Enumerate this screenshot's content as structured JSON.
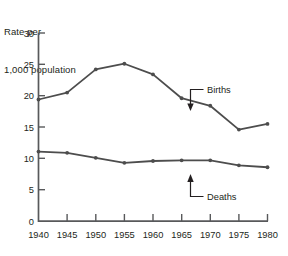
{
  "chart_data": {
    "type": "line",
    "title": "Rate per\n1,000 population",
    "title_line1": "Rate per",
    "title_line2": "1,000 population",
    "xlabel": "",
    "ylabel": "Rate per 1,000 population",
    "x": [
      1940,
      1945,
      1950,
      1955,
      1960,
      1965,
      1970,
      1975,
      1980
    ],
    "categories": [
      "1940",
      "1945",
      "1950",
      "1955",
      "1960",
      "1965",
      "1970",
      "1975",
      "1980"
    ],
    "xlim": [
      1940,
      1980
    ],
    "ylim": [
      0,
      30
    ],
    "yticks": [
      0,
      5,
      10,
      15,
      20,
      25,
      30
    ],
    "ytick_labels": [
      "0",
      "5",
      "10",
      "15",
      "20",
      "25",
      "30"
    ],
    "xticks": [
      1940,
      1945,
      1950,
      1955,
      1960,
      1965,
      1970,
      1975,
      1980
    ],
    "xtick_labels": [
      "1940",
      "1945",
      "1950",
      "1955",
      "1960",
      "1965",
      "1970",
      "1975",
      "1980"
    ],
    "grid": false,
    "legend_position": "inline-annotations",
    "series": [
      {
        "name": "Births",
        "values": [
          19.4,
          20.5,
          24.2,
          25.1,
          23.4,
          19.6,
          18.4,
          14.6,
          15.5
        ],
        "color": "#4d4d4d",
        "marker": "dot"
      },
      {
        "name": "Deaths",
        "values": [
          11.1,
          10.9,
          10.1,
          9.3,
          9.6,
          9.7,
          9.7,
          8.9,
          8.6
        ],
        "color": "#4d4d4d",
        "marker": "dot"
      }
    ],
    "annotations": [
      {
        "text": "Births",
        "points_to_year": 1965,
        "points_to_value": 19.6
      },
      {
        "text": "Deaths",
        "points_to_year": 1967.5,
        "points_to_value": 9.7
      }
    ]
  },
  "colors": {
    "axis": "#58595b",
    "line": "#4d4d4d",
    "text": "#231f20",
    "background": "#ffffff"
  },
  "labels": {
    "title_line1": "Rate per",
    "title_line2": "1,000 population",
    "births": "Births",
    "deaths": "Deaths"
  }
}
